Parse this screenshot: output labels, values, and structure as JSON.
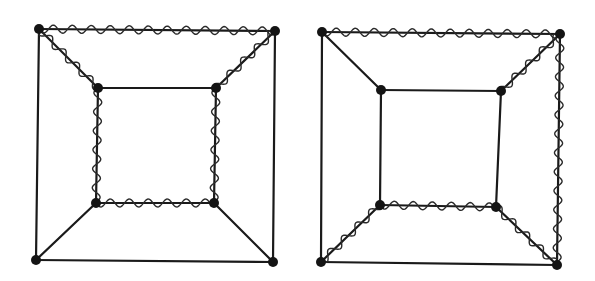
{
  "diagram": {
    "title": "",
    "graphs": [
      {
        "id": "left-graph",
        "nodes": {
          "OTL": [
            39,
            29
          ],
          "OTR": [
            275,
            31
          ],
          "OBL": [
            36,
            260
          ],
          "OBR": [
            273,
            262
          ],
          "ITL": [
            98,
            88
          ],
          "ITR": [
            216,
            88
          ],
          "IBL": [
            96,
            203
          ],
          "IBR": [
            214,
            203
          ]
        },
        "edges": [
          [
            "OTL",
            "OTR"
          ],
          [
            "OTR",
            "OBR"
          ],
          [
            "OBR",
            "OBL"
          ],
          [
            "OBL",
            "OTL"
          ],
          [
            "ITL",
            "ITR"
          ],
          [
            "ITR",
            "IBR"
          ],
          [
            "IBR",
            "IBL"
          ],
          [
            "IBL",
            "ITL"
          ],
          [
            "OTL",
            "ITL"
          ],
          [
            "OTR",
            "ITR"
          ],
          [
            "OBL",
            "IBL"
          ],
          [
            "OBR",
            "IBR"
          ]
        ],
        "wavy_edges": [
          [
            "OTL",
            "OTR"
          ],
          [
            "OTL",
            "ITL"
          ],
          [
            "OTR",
            "ITR"
          ],
          [
            "ITL",
            "IBL"
          ],
          [
            "ITR",
            "IBR"
          ],
          [
            "IBL",
            "IBR"
          ]
        ]
      },
      {
        "id": "right-graph",
        "nodes": {
          "OTL": [
            322,
            32
          ],
          "OTR": [
            560,
            34
          ],
          "OBL": [
            321,
            262
          ],
          "OBR": [
            557,
            265
          ],
          "ITL": [
            381,
            90
          ],
          "ITR": [
            501,
            91
          ],
          "IBL": [
            380,
            205
          ],
          "IBR": [
            496,
            207
          ]
        },
        "edges": [
          [
            "OTL",
            "OTR"
          ],
          [
            "OTR",
            "OBR"
          ],
          [
            "OBR",
            "OBL"
          ],
          [
            "OBL",
            "OTL"
          ],
          [
            "ITL",
            "ITR"
          ],
          [
            "ITR",
            "IBR"
          ],
          [
            "IBR",
            "IBL"
          ],
          [
            "IBL",
            "ITL"
          ],
          [
            "OTL",
            "ITL"
          ],
          [
            "OTR",
            "ITR"
          ],
          [
            "OBL",
            "IBL"
          ],
          [
            "OBR",
            "IBR"
          ]
        ],
        "wavy_edges": [
          [
            "OTL",
            "OTR"
          ],
          [
            "OTR",
            "OBR"
          ],
          [
            "OTR",
            "ITR"
          ],
          [
            "IBL",
            "IBR"
          ],
          [
            "OBL",
            "IBL"
          ],
          [
            "OBR",
            "IBR"
          ]
        ]
      }
    ],
    "style": {
      "edge_color": "#1a1a1a",
      "node_color": "#141414",
      "wave_wavelength": 19,
      "wave_amplitude": 4,
      "node_radius": 5
    }
  }
}
